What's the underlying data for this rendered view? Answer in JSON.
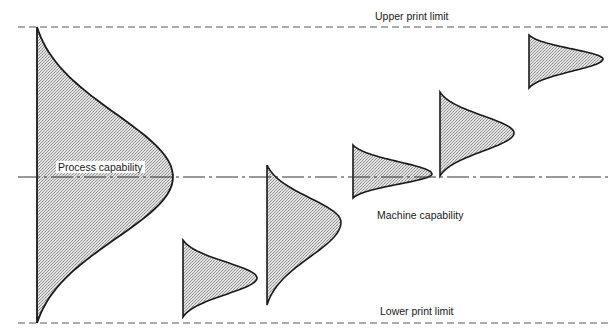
{
  "labels": {
    "upper_limit": "Upper print limit",
    "lower_limit": "Lower print limit",
    "process_capability": "Process capability",
    "machine_capability": "Machine capability"
  },
  "colors": {
    "line": "#1a1a1a",
    "fill": "#c8c8c8",
    "background": "#ffffff"
  },
  "geometry": {
    "upper_limit_y": 27,
    "lower_limit_y": 323,
    "center_line_y": 177,
    "process_curve": {
      "base_x": 37,
      "top_y": 27,
      "bottom_y": 323,
      "peak_x": 173,
      "peak_y": 177
    },
    "machine_curves": [
      {
        "base_x": 183,
        "top_y": 240,
        "bottom_y": 317,
        "peak_x": 257,
        "peak_y": 278
      },
      {
        "base_x": 267,
        "top_y": 165,
        "bottom_y": 305,
        "peak_x": 341,
        "peak_y": 222
      },
      {
        "base_x": 353,
        "top_y": 145,
        "bottom_y": 198,
        "peak_x": 432,
        "peak_y": 174
      },
      {
        "base_x": 440,
        "top_y": 92,
        "bottom_y": 176,
        "peak_x": 514,
        "peak_y": 133
      },
      {
        "base_x": 529,
        "top_y": 35,
        "bottom_y": 88,
        "peak_x": 603,
        "peak_y": 59
      }
    ]
  }
}
